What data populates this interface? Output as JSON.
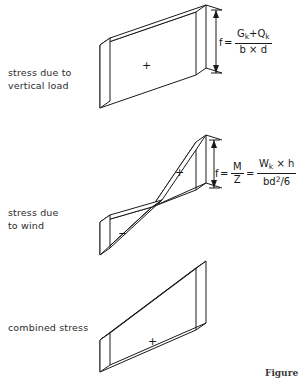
{
  "figure": {
    "caption_partial": "Figure",
    "background_color": "#ffffff",
    "line_color": "#1a1a1a"
  },
  "rows": [
    {
      "id": "vertical-load",
      "label_line1": "stress due to",
      "label_line2": "vertical load",
      "sign": "+",
      "shape": "uniform-rectangular-stress-block",
      "formula": {
        "lhs": "f",
        "equals": "=",
        "numerator": "Gk + Qk",
        "denominator": "b × d",
        "numerator_parts": [
          "G",
          "k",
          "+",
          "Q",
          "k"
        ],
        "denominator_parts": [
          "b",
          "×",
          "d"
        ]
      }
    },
    {
      "id": "wind",
      "label_line1": "stress due",
      "label_line2": "to wind",
      "sign_positive": "+",
      "sign_negative": "−",
      "shape": "bowtie-bending-stress-block",
      "formula": {
        "lhs": "f",
        "equals": "=",
        "first_num": "M",
        "first_den": "Z",
        "equals2": "=",
        "numerator": "Wk × h",
        "denominator": "bd2/6",
        "numerator_parts": [
          "W",
          "k",
          "×",
          "h"
        ],
        "denominator_parts": [
          "bd",
          "2",
          "/6"
        ]
      }
    },
    {
      "id": "combined",
      "label_line1": "combined stress",
      "sign": "+",
      "shape": "trapezoidal-combined-stress-block"
    }
  ],
  "symbols": {
    "plus": "+",
    "minus": "−",
    "times": "×",
    "equals": "="
  }
}
